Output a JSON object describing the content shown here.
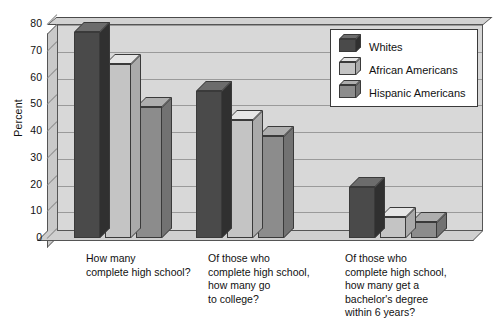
{
  "chart_data": {
    "type": "bar",
    "title": "",
    "subtitle": "",
    "xlabel": "",
    "ylabel": "Percent",
    "ylim": [
      0,
      80
    ],
    "yticks": [
      0,
      10,
      20,
      30,
      40,
      50,
      60,
      70,
      80
    ],
    "grid": true,
    "legend_position": "top-right",
    "style": "3d-bar",
    "categories": [
      "How many\ncomplete high school?",
      "Of those who\ncomplete high school,\nhow many go\nto college?",
      "Of those who\ncomplete high school,\nhow many get a\nbachelor's degree\nwithin 6 years?"
    ],
    "series": [
      {
        "name": "Whites",
        "color": "#4a4a4a",
        "values": [
          77,
          55,
          19
        ]
      },
      {
        "name": "African Americans",
        "color": "#c4c4c4",
        "values": [
          65,
          44,
          8
        ]
      },
      {
        "name": "Hispanic Americans",
        "color": "#8c8c8c",
        "values": [
          49,
          38,
          6
        ]
      }
    ]
  },
  "legend": {
    "items": [
      {
        "label": "Whites",
        "color": "#4a4a4a"
      },
      {
        "label": "African Americans",
        "color": "#c4c4c4"
      },
      {
        "label": "Hispanic Americans",
        "color": "#8c8c8c"
      }
    ]
  },
  "axis": {
    "y_title": "Percent",
    "y_ticks": [
      "80",
      "70",
      "60",
      "50",
      "40",
      "30",
      "20",
      "10",
      "0"
    ]
  },
  "colors": {
    "plot_background": "#d8d8d8",
    "page_background": "#ffffff",
    "gridline": "#9a9a9a",
    "text": "#111111",
    "border": "#3a3a3a"
  }
}
